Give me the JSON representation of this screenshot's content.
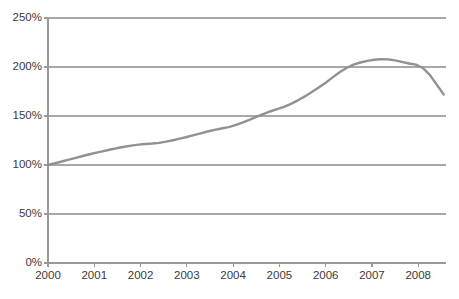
{
  "chart_data": {
    "type": "line",
    "title": "",
    "subtitle": "",
    "xlabel": "",
    "ylabel": "",
    "grid": true,
    "legend": false,
    "legend_position": "none",
    "line_color": "#919191",
    "gridline_color": "#a8a8a8",
    "axis_color": "#999999",
    "background_color": "#ffffff",
    "xlim": [
      2000,
      2008.6
    ],
    "ylim": [
      0,
      250
    ],
    "x_tick_labels": [
      "2000",
      "2001",
      "2002",
      "2003",
      "2004",
      "2005",
      "2006",
      "2007",
      "2008"
    ],
    "x_tick_values": [
      2000,
      2001,
      2002,
      2003,
      2004,
      2005,
      2006,
      2007,
      2008
    ],
    "y_tick_labels": [
      "0%",
      "50%",
      "100%",
      "150%",
      "200%",
      "250%"
    ],
    "y_tick_values": [
      0,
      50,
      100,
      150,
      200,
      250
    ],
    "series": [
      {
        "name": "index",
        "color": "#919191",
        "x": [
          2000.0,
          2000.15,
          2000.3,
          2000.45,
          2000.6,
          2000.75,
          2000.9,
          2001.05,
          2001.2,
          2001.35,
          2001.5,
          2001.65,
          2001.8,
          2001.95,
          2002.1,
          2002.25,
          2002.4,
          2002.55,
          2002.7,
          2002.85,
          2003.0,
          2003.15,
          2003.3,
          2003.45,
          2003.6,
          2003.75,
          2003.9,
          2004.05,
          2004.2,
          2004.35,
          2004.5,
          2004.65,
          2004.8,
          2004.95,
          2005.1,
          2005.25,
          2005.4,
          2005.55,
          2005.7,
          2005.85,
          2006.0,
          2006.15,
          2006.3,
          2006.45,
          2006.6,
          2006.75,
          2006.9,
          2007.05,
          2007.2,
          2007.35,
          2007.5,
          2007.65,
          2007.8,
          2007.95,
          2008.1,
          2008.25,
          2008.4,
          2008.55
        ],
        "y": [
          100.0,
          101.8,
          103.6,
          105.5,
          107.3,
          109.2,
          111.0,
          112.6,
          114.2,
          115.8,
          117.3,
          118.6,
          119.8,
          120.8,
          121.4,
          121.9,
          122.6,
          123.8,
          125.3,
          126.9,
          128.6,
          130.4,
          132.3,
          134.2,
          135.8,
          137.2,
          138.6,
          140.6,
          143.2,
          146.0,
          149.0,
          152.0,
          154.6,
          157.0,
          159.4,
          162.4,
          166.0,
          170.0,
          174.4,
          179.0,
          184.0,
          189.4,
          194.6,
          199.0,
          202.4,
          204.6,
          206.2,
          207.4,
          208.0,
          207.8,
          206.8,
          205.2,
          203.6,
          202.4,
          199.0,
          192.0,
          182.0,
          172.0
        ]
      }
    ],
    "annotations": []
  },
  "geometry": {
    "plot_left": 48,
    "plot_right": 446,
    "plot_top": 18,
    "plot_bottom": 263
  }
}
